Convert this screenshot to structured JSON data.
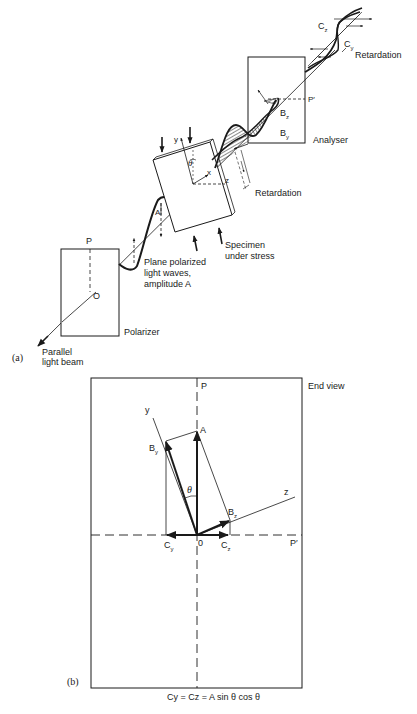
{
  "figure": {
    "part_a": {
      "tag": "(a)",
      "labels": {
        "parallel_light_beam": "Parallel\nlight beam",
        "polarizer": "Polarizer",
        "P": "P",
        "O": "O",
        "plane_polarized": "Plane polarized\nlight waves,\namplitude A",
        "A": "A",
        "specimen": "Specimen\nunder stress",
        "y": "y",
        "x": "x",
        "z": "z",
        "theta": "θ",
        "retardation_mid": "Retardation",
        "analyser": "Analyser",
        "P_prime": "P′",
        "Bz": "B",
        "Bz_sub": "z",
        "By": "B",
        "By_sub": "y",
        "Cz": "C",
        "Cz_sub": "z",
        "Cy": "C",
        "Cy_sub": "y",
        "retardation_top": "Retardation"
      }
    },
    "part_b": {
      "tag": "(b)",
      "title": "End view",
      "labels": {
        "P": "P",
        "P_prime": "P′",
        "y": "y",
        "z": "z",
        "A": "A",
        "By": "B",
        "By_sub": "y",
        "Bz": "B",
        "Bz_sub": "z",
        "theta": "θ",
        "origin": "0",
        "Cy": "C",
        "Cy_sub": "y",
        "Cz": "C",
        "Cz_sub": "z"
      },
      "equation": "Cy = Cz = A sin θ  cos θ"
    }
  }
}
